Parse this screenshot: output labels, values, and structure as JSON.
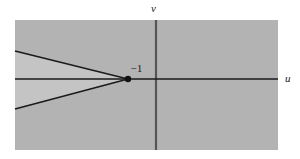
{
  "figure": {
    "background_color": "#ffffff",
    "width": 300,
    "height": 159
  },
  "plane": {
    "name": "uv-plane",
    "fill_color": "#b3b3b3",
    "bounds": {
      "x": 15,
      "y": 20,
      "width": 263,
      "height": 130
    }
  },
  "axes": {
    "horizontal": {
      "label": "u",
      "y": 79,
      "x_start": 15,
      "x_end": 278,
      "color": "#1a1a1a"
    },
    "vertical": {
      "label": "v",
      "x": 156,
      "y_start": 20,
      "y_end": 150,
      "color": "#555555"
    }
  },
  "point": {
    "label": "−1",
    "value": -1,
    "x": 128,
    "y": 79,
    "radius": 3.2,
    "color": "#111111"
  },
  "wedge": {
    "name": "cone-region",
    "fill_color": "#c4c4c4",
    "edge_color": "#1a1a1a",
    "apex": {
      "x": 128,
      "y": 79
    },
    "upper_edge_end": {
      "x": 15,
      "y": 51
    },
    "lower_edge_end": {
      "x": 15,
      "y": 109
    }
  },
  "chart_data": {
    "type": "scatter",
    "title": "",
    "xlabel": "u",
    "ylabel": "v",
    "annotations": [
      {
        "text": "−1",
        "x": -1,
        "y": 0,
        "role": "point-label"
      },
      {
        "text": "u",
        "role": "x-axis-label"
      },
      {
        "text": "v",
        "role": "y-axis-label"
      }
    ],
    "points": [
      {
        "label": "−1",
        "x": -1,
        "y": 0
      }
    ],
    "regions": [
      {
        "name": "wedge",
        "description": "Shaded cone opening leftward from the point -1",
        "apex": [
          -1,
          0
        ],
        "edges": [
          {
            "from": [
              -1,
              0
            ],
            "to": [
              -4.95,
              1.23
            ]
          },
          {
            "from": [
              -1,
              0
            ],
            "to": [
              -4.95,
              -1.31
            ]
          }
        ]
      }
    ],
    "xlim": [
      -4.95,
      5.35
    ],
    "ylim": [
      -3.1,
      2.58
    ],
    "grid": false,
    "legend": false
  }
}
